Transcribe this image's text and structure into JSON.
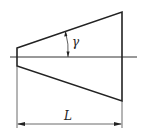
{
  "diagram": {
    "labels": {
      "angle": "γ",
      "length": "L"
    },
    "colors": {
      "stroke": "#222222",
      "background": "#ffffff"
    },
    "geometry": {
      "left_edge": {
        "x": 17,
        "top": 48,
        "bottom": 66
      },
      "right_edge": {
        "x": 122,
        "top": 12,
        "bottom": 101
      },
      "centerline_y": 57,
      "centerline_x": [
        10,
        137
      ],
      "dimension_y": 124
    }
  }
}
